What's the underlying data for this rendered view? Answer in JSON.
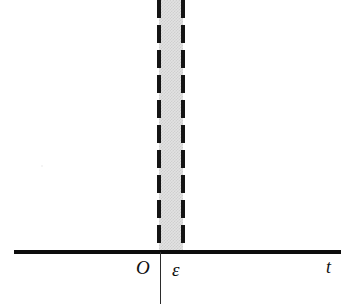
{
  "figure": {
    "background_color": "#ffffff",
    "width": 356,
    "height": 304
  },
  "axes": {
    "horizontal_axis_name": "t-axis",
    "horizontal_axis_label": "t",
    "origin_label": "O",
    "vertical_axis_name": "value-axis",
    "axis_color": "#0d0d0d"
  },
  "band": {
    "label": "ε",
    "left_boundary_label": "0",
    "right_boundary_label": "ε",
    "fill_color": "#e2e2e2",
    "boundary_color": "#141414",
    "boundary_style": "dashed"
  },
  "chart_data": {
    "type": "area",
    "title": "",
    "subtitle": "",
    "xlabel": "t",
    "ylabel": "",
    "grid": false,
    "legend": null,
    "xlim": [
      -0.55,
      7.4
    ],
    "ylim": [
      0,
      5.6
    ],
    "x_tick_labels": [
      "O",
      "ε"
    ],
    "x_tick_values": [
      0,
      0.55
    ],
    "y_tick_labels": [],
    "annotations": [
      {
        "text": "O",
        "x": 0,
        "y": 0,
        "note": "origin label below axis"
      },
      {
        "text": "ε",
        "x": 0.55,
        "y": 0,
        "note": "epsilon tick label below axis"
      },
      {
        "text": "t",
        "x": 7.2,
        "y": 0,
        "note": "horizontal axis name"
      }
    ],
    "series": [
      {
        "name": "impulse-band",
        "type": "area",
        "description": "Tall narrow shaded rectangle of unit area spanning t in [0, ε], height extends beyond the top of the plotting frame (clipped).",
        "x": [
          0,
          0.55
        ],
        "values": [
          5.6,
          5.6
        ],
        "fill": "#e2e2e2",
        "edge_style": "dashed",
        "edge_color": "#141414",
        "clipped_at_top": true
      }
    ]
  }
}
